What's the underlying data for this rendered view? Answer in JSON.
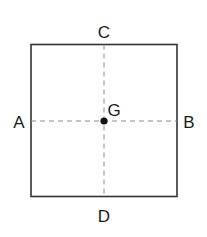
{
  "diagram": {
    "type": "square with center point and dashed midlines",
    "labels": {
      "top": "C",
      "bottom": "D",
      "left": "A",
      "right": "B",
      "center": "G"
    },
    "colors": {
      "stroke": "#333333",
      "dashed": "#888888",
      "point": "#111111",
      "text": "#1a1a1a"
    },
    "elements": [
      {
        "id": "square",
        "description": "square outline"
      },
      {
        "id": "line-AB",
        "description": "horizontal dashed line from A to B through G"
      },
      {
        "id": "line-CD",
        "description": "vertical dashed line from C to D through G"
      },
      {
        "id": "point-G",
        "description": "center point G"
      }
    ]
  }
}
